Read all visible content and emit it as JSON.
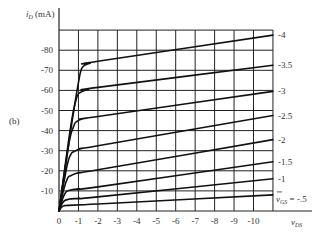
{
  "figure": {
    "panel_label": "(b)"
  },
  "chart_data": {
    "type": "line",
    "title": "",
    "xlabel": "v_DS",
    "ylabel": "i_D (mA)",
    "x_ticks": [
      "0",
      "-1",
      "-2",
      "-3",
      "-4",
      "-5",
      "-6",
      "-7",
      "-8",
      "-9",
      "-10"
    ],
    "y_ticks": [
      "-10",
      "-20",
      "-30",
      "-40",
      "-50",
      "-60",
      "-70",
      "-80"
    ],
    "xlim": [
      0,
      -11
    ],
    "ylim": [
      0,
      -90
    ],
    "grid": true,
    "legend_position": "right-edge inline labels",
    "series_label_prefix": "v_GS =",
    "series": [
      {
        "name": "-4",
        "points": [
          [
            0,
            0
          ],
          [
            -0.6,
            -40
          ],
          [
            -1.0,
            -64
          ],
          [
            -1.2,
            -71.5
          ],
          [
            -1.6,
            -73.5
          ],
          [
            -2,
            -74.5
          ],
          [
            -11,
            -87.5
          ]
        ]
      },
      {
        "name": "-3.5",
        "points": [
          [
            0,
            0
          ],
          [
            -0.6,
            -42
          ],
          [
            -0.9,
            -56
          ],
          [
            -1.1,
            -59
          ],
          [
            -1.5,
            -60.5
          ],
          [
            -2,
            -61.5
          ],
          [
            -11,
            -72.5
          ]
        ]
      },
      {
        "name": "-3",
        "points": [
          [
            0,
            0
          ],
          [
            -0.5,
            -33
          ],
          [
            -0.75,
            -42
          ],
          [
            -0.9,
            -44.5
          ],
          [
            -1.3,
            -46
          ],
          [
            -2,
            -47
          ],
          [
            -11,
            -59.5
          ]
        ]
      },
      {
        "name": "-2.5",
        "points": [
          [
            0,
            0
          ],
          [
            -0.4,
            -22
          ],
          [
            -0.6,
            -28
          ],
          [
            -0.75,
            -29.5
          ],
          [
            -1.2,
            -31.2
          ],
          [
            -2,
            -32.5
          ],
          [
            -11,
            -47.5
          ]
        ]
      },
      {
        "name": "-2",
        "points": [
          [
            0,
            0
          ],
          [
            -0.25,
            -11
          ],
          [
            -0.45,
            -16.5
          ],
          [
            -0.6,
            -17.5
          ],
          [
            -1,
            -19
          ],
          [
            -2,
            -20.5
          ],
          [
            -11,
            -35.5
          ]
        ]
      },
      {
        "name": "-1.5",
        "points": [
          [
            0,
            0
          ],
          [
            -0.2,
            -6.5
          ],
          [
            -0.35,
            -9.3
          ],
          [
            -0.5,
            -10.2
          ],
          [
            -1,
            -11
          ],
          [
            -2,
            -12
          ],
          [
            -11,
            -24.5
          ]
        ]
      },
      {
        "name": "-1",
        "points": [
          [
            0,
            0
          ],
          [
            -0.15,
            -3.5
          ],
          [
            -0.3,
            -5.2
          ],
          [
            -0.5,
            -5.8
          ],
          [
            -1,
            -6.3
          ],
          [
            -2,
            -7
          ],
          [
            -11,
            -16
          ]
        ]
      },
      {
        "name": "-.5",
        "points": [
          [
            0,
            0
          ],
          [
            -0.1,
            -1.5
          ],
          [
            -0.2,
            -2.4
          ],
          [
            -0.4,
            -2.8
          ],
          [
            -1,
            -3.1
          ],
          [
            -2,
            -3.5
          ],
          [
            -11,
            -8
          ]
        ]
      }
    ],
    "series_labels": [
      "-4",
      "-3.5",
      "-3",
      "-2.5",
      "-2",
      "-1.5",
      "-1",
      "v_GS = -.5"
    ]
  }
}
